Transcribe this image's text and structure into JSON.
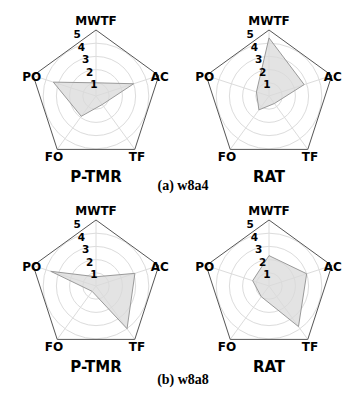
{
  "chart_data": [
    {
      "type": "radar",
      "title": "P-TMR",
      "group": "w8a4",
      "axes": [
        "MWTF",
        "AC",
        "TF",
        "FO",
        "PO"
      ],
      "rlim": [
        0,
        5
      ],
      "ring_ticks": [
        "1",
        "2",
        "3",
        "4",
        "5"
      ],
      "values": [
        1.0,
        3.0,
        0.8,
        1.9,
        3.4
      ],
      "grid": true
    },
    {
      "type": "radar",
      "title": "RAT",
      "group": "w8a4",
      "axes": [
        "MWTF",
        "AC",
        "TF",
        "FO",
        "PO"
      ],
      "rlim": [
        0,
        5
      ],
      "ring_ticks": [
        "1",
        "2",
        "3",
        "4",
        "5"
      ],
      "values": [
        4.4,
        2.8,
        0.7,
        1.3,
        1.0
      ],
      "grid": true
    },
    {
      "type": "radar",
      "title": "P-TMR",
      "group": "w8a8",
      "axes": [
        "MWTF",
        "AC",
        "TF",
        "FO",
        "PO"
      ],
      "rlim": [
        0,
        5
      ],
      "ring_ticks": [
        "1",
        "2",
        "3",
        "4",
        "5"
      ],
      "values": [
        0.7,
        3.1,
        4.0,
        0.5,
        3.6
      ],
      "grid": true
    },
    {
      "type": "radar",
      "title": "RAT",
      "group": "w8a8",
      "axes": [
        "MWTF",
        "AC",
        "TF",
        "FO",
        "PO"
      ],
      "rlim": [
        0,
        5
      ],
      "ring_ticks": [
        "1",
        "2",
        "3",
        "4",
        "5"
      ],
      "values": [
        2.3,
        3.0,
        3.8,
        1.0,
        1.3
      ],
      "grid": true
    }
  ],
  "captions": [
    "(a) w8a4",
    "(b) w8a8"
  ],
  "colors": {
    "fill": "#d9d9d9",
    "stroke": "#9a9a9a",
    "grid": "#dcdcdc",
    "frame": "#555555"
  }
}
